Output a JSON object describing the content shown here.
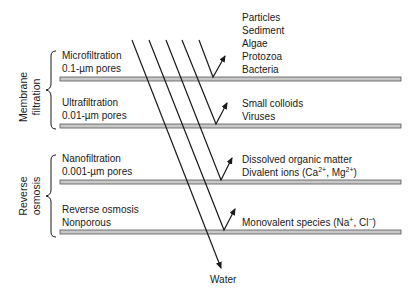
{
  "groups": [
    {
      "label_line1": "Membrane",
      "label_line2": "filtration"
    },
    {
      "label_line1": "Reverse",
      "label_line2": "osmosis"
    }
  ],
  "membranes": [
    {
      "name": "Microfiltration",
      "pore": "0.1-µm pores",
      "rejected": [
        "Particles",
        "Sediment",
        "Algae",
        "Protozoa",
        "Bacteria"
      ]
    },
    {
      "name": "Ultrafiltration",
      "pore": "0.01-µm pores",
      "rejected": [
        "Small colloids",
        "Viruses"
      ]
    },
    {
      "name": "Nanofiltration",
      "pore": "0.001-µm pores",
      "rejected": [
        "Dissolved organic matter"
      ],
      "rejected_ions": {
        "prefix": "Divalent ions (Ca",
        "sup1": "2+",
        "mid": ", Mg",
        "sup2": "2+",
        "suffix": ")"
      }
    },
    {
      "name": "Reverse osmosis",
      "pore": "Nonporous",
      "rejected_ions": {
        "prefix": "Monovalent species (Na",
        "sup1": "+",
        "mid": ", Cl",
        "sup2": "−",
        "suffix": ")"
      }
    }
  ],
  "permeate_label": "Water",
  "colors": {
    "membrane_fill": "#c8c8c8",
    "membrane_stroke": "#555555",
    "line": "#1a1a1a"
  }
}
